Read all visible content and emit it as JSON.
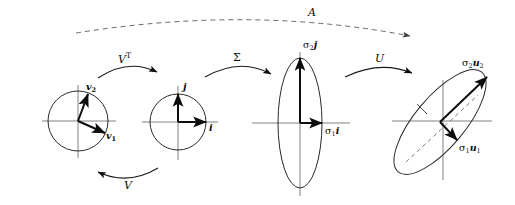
{
  "figure": {
    "background_color": "#ffffff",
    "ink_color": "#0d0d0d",
    "axis_color": "#808080",
    "width": 515,
    "height": 205
  },
  "operators": {
    "a": "A",
    "v_transpose": "V",
    "v_transpose_sup": "T",
    "sigma": "Σ",
    "u": "U",
    "v": "V"
  },
  "stages": [
    {
      "id": "stage-1",
      "shape": "circle",
      "name": "unit-circle-domain",
      "vectors": [
        {
          "id": "v1",
          "label_base": "v",
          "label_sub": "1",
          "direction_deg": -20
        },
        {
          "id": "v2",
          "label_base": "v",
          "label_sub": "2",
          "direction_deg": 72
        }
      ]
    },
    {
      "id": "stage-2",
      "shape": "circle",
      "name": "unit-circle-rotated",
      "vectors": [
        {
          "id": "i",
          "label_base": "i",
          "label_sub": "",
          "direction_deg": 0
        },
        {
          "id": "j",
          "label_base": "j",
          "label_sub": "",
          "direction_deg": 90
        }
      ]
    },
    {
      "id": "stage-3",
      "shape": "ellipse-vertical",
      "name": "scaled-ellipse",
      "vectors": [
        {
          "id": "sigma1-i",
          "sigma_sub": "1",
          "basis": "i",
          "direction_deg": 0
        },
        {
          "id": "sigma2-j",
          "sigma_sub": "2",
          "basis": "j",
          "direction_deg": 90
        }
      ]
    },
    {
      "id": "stage-4",
      "shape": "ellipse-tilted",
      "name": "rotated-ellipse-image",
      "rotation_deg": -40,
      "vectors": [
        {
          "id": "sigma1-u1",
          "sigma_sub": "1",
          "basis": "u",
          "basis_sub": "1",
          "direction_deg": -50
        },
        {
          "id": "sigma2-u2",
          "sigma_sub": "2",
          "basis": "u",
          "basis_sub": "2",
          "direction_deg": 40
        }
      ]
    }
  ],
  "labels": {
    "v1": {
      "base": "v",
      "sub": "1"
    },
    "v2": {
      "base": "v",
      "sub": "2"
    },
    "i": {
      "base": "i",
      "sub": ""
    },
    "j": {
      "base": "j",
      "sub": ""
    },
    "sigma1_i": {
      "sigma": "σ",
      "sub": "1",
      "basis": "i"
    },
    "sigma2_j": {
      "sigma": "σ",
      "sub": "2",
      "basis": "j"
    },
    "sigma1_u1": {
      "sigma": "σ",
      "sub": "1",
      "basis": "u",
      "basis_sub": "1"
    },
    "sigma2_u2": {
      "sigma": "σ",
      "sub": "2",
      "basis": "u",
      "basis_sub": "2"
    }
  }
}
